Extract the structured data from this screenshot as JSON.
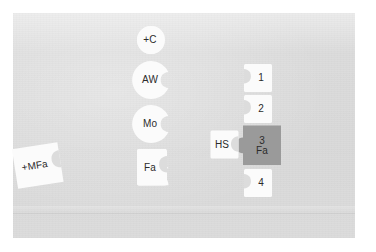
{
  "scene": {
    "title": "Puzzle-piece layout of labeled tiles on a gray surface",
    "background_color": "#dcdcdc",
    "canvas_color": "#ffffff",
    "tile_white": "#fbfbfb",
    "tile_gray": "#9a9a9a",
    "text_color": "#2b2b2b"
  },
  "center_column": {
    "name": "center-column",
    "tiles": [
      {
        "id": "plus-c",
        "label": "+C",
        "shape": "circle-notch-right",
        "fill": "#fbfbfb"
      },
      {
        "id": "aw",
        "label": "AW",
        "shape": "circle-notch-right",
        "fill": "#fbfbfb"
      },
      {
        "id": "mo",
        "label": "Mo",
        "shape": "circle-notch-right",
        "fill": "#fbfbfb"
      },
      {
        "id": "fa",
        "label": "Fa",
        "shape": "square-notch-right",
        "fill": "#fbfbfb"
      }
    ]
  },
  "right_column": {
    "name": "right-column",
    "tiles": [
      {
        "id": "num-1",
        "label": "1",
        "shape": "square-notch-left",
        "fill": "#fbfbfb"
      },
      {
        "id": "num-2",
        "label": "2",
        "shape": "square-notch-left",
        "fill": "#fbfbfb"
      },
      {
        "id": "num-3-fa",
        "label_top": "3",
        "label_bottom": "Fa",
        "shape": "square-tab-left",
        "fill": "#9a9a9a"
      },
      {
        "id": "num-4",
        "label": "4",
        "shape": "square-notch-left",
        "fill": "#fbfbfb"
      }
    ]
  },
  "connector": {
    "id": "hs",
    "label": "HS",
    "shape": "square-notch-right",
    "fill": "#fbfbfb"
  },
  "left_tile": {
    "id": "plus-mfa",
    "label": "+MFa",
    "shape": "square-notch-right-rotated",
    "rotation_deg": -9,
    "fill": "#fbfbfb"
  }
}
